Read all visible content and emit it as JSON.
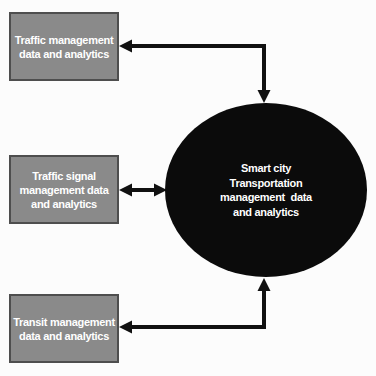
{
  "boxes": [
    {
      "id": "traffic-management",
      "lines": [
        "Traffic management",
        "data and analytics"
      ]
    },
    {
      "id": "traffic-signal-management",
      "lines": [
        "Traffic signal",
        "management data",
        "and analytics"
      ]
    },
    {
      "id": "transit-management",
      "lines": [
        "Transit management",
        "data and analytics"
      ]
    }
  ],
  "hub": {
    "lines": [
      "Smart city",
      "Transportation",
      "management  data",
      "and analytics"
    ]
  },
  "connectors": [
    {
      "from": "traffic-management",
      "to": "hub",
      "type": "double-headed-arrow",
      "route": "elbow-right-then-down"
    },
    {
      "from": "traffic-signal-management",
      "to": "hub",
      "type": "double-headed-arrow",
      "route": "straight-horizontal"
    },
    {
      "from": "transit-management",
      "to": "hub",
      "type": "double-headed-arrow",
      "route": "elbow-right-then-up"
    }
  ],
  "colors": {
    "background": "#fcfcfc",
    "box_fill": "#8a8a8a",
    "box_border": "#4e4e4e",
    "box_text": "#ffffff",
    "hub_fill": "#0b0b0b",
    "hub_text": "#ffffff",
    "arrow": "#111111"
  }
}
